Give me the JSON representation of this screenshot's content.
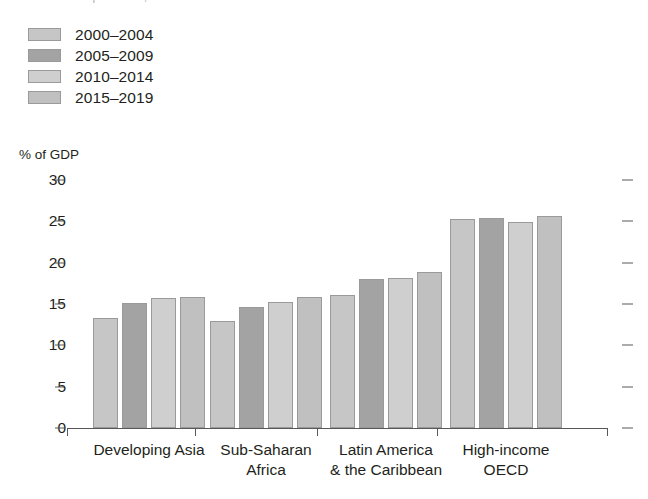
{
  "title_remnant": "Components, % of GDP",
  "axis_title": "% of GDP",
  "legend": {
    "items": [
      {
        "label": "2000–2004",
        "color": "#c6c6c6"
      },
      {
        "label": "2005–2009",
        "color": "#a3a3a3"
      },
      {
        "label": "2010–2014",
        "color": "#cfcfcf"
      },
      {
        "label": "2015–2019",
        "color": "#c0c0c0"
      }
    ]
  },
  "chart_data": {
    "type": "bar",
    "title": "",
    "subtitle": "",
    "xlabel": "",
    "ylabel": "% of GDP",
    "ylim": [
      0,
      30
    ],
    "yticks": [
      0,
      5,
      10,
      15,
      20,
      25,
      30
    ],
    "ytick_labels": [
      "0",
      "5",
      "10",
      "15",
      "20",
      "25",
      "30"
    ],
    "grid": false,
    "legend_position": "top-left",
    "categories": [
      "Developing Asia",
      "Sub-Saharan\nAfrica",
      "Latin America\n& the Caribbean",
      "High-income\nOECD"
    ],
    "series": [
      {
        "name": "2000–2004",
        "color": "#c6c6c6",
        "values": [
          13.3,
          13.0,
          16.1,
          25.3
        ]
      },
      {
        "name": "2005–2009",
        "color": "#a3a3a3",
        "values": [
          15.1,
          14.6,
          18.0,
          25.4
        ]
      },
      {
        "name": "2010–2014",
        "color": "#cfcfcf",
        "values": [
          15.7,
          15.2,
          18.1,
          24.9
        ]
      },
      {
        "name": "2015–2019",
        "color": "#c0c0c0",
        "values": [
          15.9,
          15.8,
          18.9,
          25.7
        ]
      }
    ]
  }
}
